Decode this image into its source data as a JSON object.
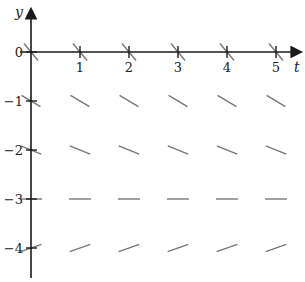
{
  "diagram": {
    "type": "slope_field",
    "axes": {
      "x_label": "t",
      "y_label": "y",
      "x_ticks": [
        {
          "value": 1,
          "label": "1"
        },
        {
          "value": 2,
          "label": "2"
        },
        {
          "value": 3,
          "label": "3"
        },
        {
          "value": 4,
          "label": "4"
        },
        {
          "value": 5,
          "label": "5"
        }
      ],
      "y_ticks": [
        {
          "value": 0,
          "label": "0"
        },
        {
          "value": -1,
          "label": "−1"
        },
        {
          "value": -2,
          "label": "−2"
        },
        {
          "value": -3,
          "label": "−3"
        },
        {
          "value": -4,
          "label": "−4"
        }
      ]
    },
    "grid_t": [
      0,
      1,
      2,
      3,
      4,
      5
    ],
    "rows": [
      {
        "y": 0,
        "slope": -1.2
      },
      {
        "y": -1,
        "slope": -0.6
      },
      {
        "y": -2,
        "slope": -0.4
      },
      {
        "y": -3,
        "slope": 0
      },
      {
        "y": -4,
        "slope": 0.35
      }
    ],
    "colors": {
      "axis": "#1a1a1a",
      "segment": "#777777",
      "text": "#222222"
    }
  }
}
